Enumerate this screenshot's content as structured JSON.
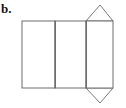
{
  "figure": {
    "label": "b.",
    "caption": "",
    "background_color": "#ffffff",
    "line_color": "#6d6d6d",
    "fill_color": "#ffffff",
    "width": 126,
    "height": 108,
    "geometry": {
      "body_rect": {
        "x1": 22,
        "y1": 21,
        "x2": 113,
        "y2": 88
      },
      "vertical_fold_lines": [
        55,
        86
      ],
      "faces": [
        {
          "name": "left-rectangle",
          "x1": 22,
          "y1": 21,
          "x2": 55,
          "y2": 88
        },
        {
          "name": "middle-rectangle",
          "x1": 55,
          "y1": 21,
          "x2": 86,
          "y2": 88
        },
        {
          "name": "right-rectangle",
          "x1": 86,
          "y1": 21,
          "x2": 113,
          "y2": 88
        }
      ],
      "top_triangle": {
        "base_left_x": 86,
        "base_right_x": 113,
        "base_y": 21,
        "apex_x": 100,
        "apex_y": 5
      },
      "bottom_triangle": {
        "base_left_x": 86,
        "base_right_x": 113,
        "base_y": 88,
        "apex_x": 100,
        "apex_y": 103
      }
    }
  }
}
